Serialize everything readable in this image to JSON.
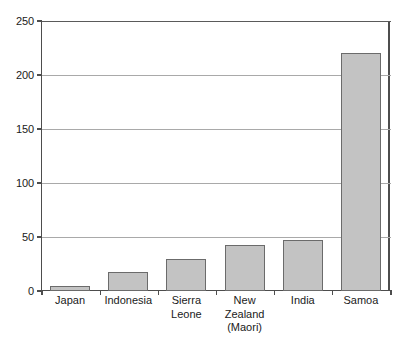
{
  "chart_data": {
    "type": "bar",
    "title": "",
    "subtitle": "",
    "xlabel": "",
    "ylabel": "",
    "categories": [
      "Japan",
      "Indonesia",
      "Sierra Leone",
      "New Zealand (Maori)",
      "India",
      "Samoa"
    ],
    "category_label_lines": [
      [
        "Japan"
      ],
      [
        "Indonesia"
      ],
      [
        "Sierra",
        "Leone"
      ],
      [
        "New",
        "Zealand",
        "(Maori)"
      ],
      [
        "India"
      ],
      [
        "Samoa"
      ]
    ],
    "values": [
      5,
      18,
      30,
      43,
      47,
      220
    ],
    "ylim": [
      0,
      250
    ],
    "ytick_values": [
      0,
      50,
      100,
      150,
      200,
      250
    ],
    "ytick_labels": [
      "0",
      "50",
      "100",
      "150",
      "200",
      "250"
    ],
    "grid": true,
    "grid_axis": "y",
    "legend": "none",
    "bar_fill_color": "#c3c3c3",
    "bar_border_color": "#6b6b6b",
    "gridline_color": "#a9a9a9",
    "axis_color": "#4d4d4d",
    "background_color": "#ffffff"
  }
}
